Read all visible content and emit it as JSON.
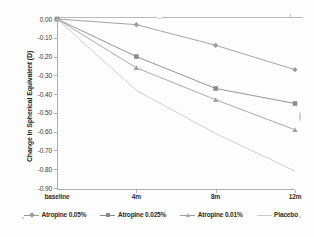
{
  "chart_data": {
    "type": "line",
    "title": "",
    "xlabel": "",
    "ylabel": "Change in Spherical Equivalent (D)",
    "categories": [
      "baseline",
      "4m",
      "8m",
      "12m"
    ],
    "ylim": [
      -0.9,
      0.0
    ],
    "ytick_labels": [
      "0.00",
      "-0.10",
      "-0.20",
      "-0.30",
      "-0.40",
      "-0.50",
      "-0.60",
      "-0.70",
      "-0.80",
      "-0.90"
    ],
    "ytick_values": [
      0.0,
      -0.1,
      -0.2,
      -0.3,
      -0.4,
      -0.5,
      -0.6,
      -0.7,
      -0.8,
      -0.9
    ],
    "grid": false,
    "legend_position": "bottom",
    "series": [
      {
        "name": "Atropine 0.05%",
        "marker": "diamond",
        "color": "#9a9a9a",
        "values": [
          0.0,
          -0.03,
          -0.14,
          -0.27
        ]
      },
      {
        "name": "Atropine 0.025%",
        "marker": "square",
        "color": "#8a8a8a",
        "values": [
          0.0,
          -0.2,
          -0.37,
          -0.45
        ]
      },
      {
        "name": "Atropine 0.01%",
        "marker": "triangle",
        "color": "#a2a2a2",
        "values": [
          0.0,
          -0.26,
          -0.43,
          -0.59
        ]
      },
      {
        "name": "Placebo",
        "marker": "none",
        "color": "#cacaca",
        "values": [
          0.0,
          -0.38,
          -0.61,
          -0.81
        ]
      }
    ]
  },
  "axes": {
    "y_title": "Change in Spherical Equivalent (D)"
  }
}
